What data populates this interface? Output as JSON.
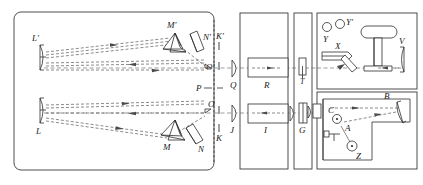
{
  "figure": {
    "background_color": "#ffffff",
    "line_color": "#2e2e2e",
    "ray_color": "#4a4a4a",
    "width": 423,
    "height": 185
  },
  "labels": {
    "l_prime": "L'",
    "l": "L",
    "m_prime": "M'",
    "m": "M",
    "n_prime": "N'",
    "n": "N",
    "k_prime": "K'",
    "k": "K",
    "o_prime": "O'",
    "o": "O",
    "p": "P",
    "q": "Q",
    "j": "J",
    "r": "R",
    "i": "I",
    "t": "T",
    "g": "G",
    "y": "Y",
    "y_prime": "Y'",
    "x": "X",
    "v": "V",
    "b": "B",
    "a": "A",
    "c": "C",
    "z": "Z"
  },
  "panels": {
    "main_left": "main-optical-bench",
    "column_r": "collimator-r-panel",
    "column_t": "slit-t-panel",
    "column_i": "collimator-i-panel",
    "column_g": "grating-g-panel",
    "upper_right": "source-chamber",
    "lower_right": "detector-chamber"
  },
  "components": [
    {
      "name": "mirror-l-prime",
      "label": "L'",
      "type": "concave-mirror"
    },
    {
      "name": "mirror-l",
      "label": "L",
      "type": "concave-mirror"
    },
    {
      "name": "prism-m-prime",
      "label": "M'",
      "type": "prism"
    },
    {
      "name": "prism-m",
      "label": "M",
      "type": "prism"
    },
    {
      "name": "plate-n-prime",
      "label": "N'",
      "type": "tilted-plate"
    },
    {
      "name": "plate-n",
      "label": "N",
      "type": "tilted-plate"
    },
    {
      "name": "slit-k-prime",
      "label": "K'",
      "type": "slit"
    },
    {
      "name": "slit-k",
      "label": "K",
      "type": "slit"
    },
    {
      "name": "point-o-prime",
      "label": "O'",
      "type": "focal-point"
    },
    {
      "name": "point-o",
      "label": "O",
      "type": "focal-point"
    },
    {
      "name": "stop-p",
      "label": "P",
      "type": "stop"
    },
    {
      "name": "lens-q",
      "label": "Q",
      "type": "lens"
    },
    {
      "name": "lens-j",
      "label": "J",
      "type": "lens"
    },
    {
      "name": "tube-r",
      "label": "R",
      "type": "tube-beam-right"
    },
    {
      "name": "tube-i",
      "label": "I",
      "type": "tube-beam-left"
    },
    {
      "name": "slit-t",
      "label": "T",
      "type": "vertical-slit"
    },
    {
      "name": "grating-g",
      "label": "G",
      "type": "grating"
    },
    {
      "name": "source-y",
      "label": "Y",
      "type": "circle-source"
    },
    {
      "name": "source-y-prime",
      "label": "Y'",
      "type": "circle-source"
    },
    {
      "name": "arm-x",
      "label": "X",
      "type": "arm"
    },
    {
      "name": "mirror-v",
      "label": "V",
      "type": "curved-mirror"
    },
    {
      "name": "mirror-b",
      "label": "B",
      "type": "curved-mirror"
    },
    {
      "name": "pivot-a",
      "label": "A",
      "type": "pivot-circle"
    },
    {
      "name": "post-c",
      "label": "C",
      "type": "pivot-circle"
    },
    {
      "name": "weight-z",
      "label": "Z",
      "type": "circle-weight"
    }
  ]
}
